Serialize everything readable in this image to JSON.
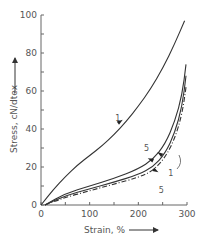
{
  "chart_data": {
    "type": "line",
    "title": "",
    "xlabel": "Strain, %",
    "ylabel": "Stress, cN/dtex",
    "xlim": [
      0,
      300
    ],
    "ylim": [
      0,
      100
    ],
    "x_major_ticks": [
      0,
      100,
      200,
      300
    ],
    "x_tick_labels": [
      "0",
      "100",
      "200",
      "300"
    ],
    "x_minor_ticks": [
      50,
      150,
      250
    ],
    "y_major_ticks": [
      0,
      20,
      40,
      60,
      80,
      100
    ],
    "y_tick_labels": [
      "0",
      "20",
      "40",
      "60",
      "80",
      "100"
    ],
    "y_minor_ticks": [
      10,
      30,
      50,
      70,
      90
    ],
    "grid": false,
    "legend": "none",
    "series": [
      {
        "name": "1 (loading)",
        "label": "1",
        "style": "solid",
        "points": [
          [
            0,
            0
          ],
          [
            25,
            8
          ],
          [
            50,
            15
          ],
          [
            75,
            21
          ],
          [
            100,
            26
          ],
          [
            125,
            31
          ],
          [
            150,
            37
          ],
          [
            175,
            44
          ],
          [
            200,
            52
          ],
          [
            225,
            61
          ],
          [
            250,
            72
          ],
          [
            275,
            85
          ],
          [
            295,
            97
          ]
        ]
      },
      {
        "name": "5 (loading)",
        "label": "5",
        "style": "solid",
        "points": [
          [
            8,
            0
          ],
          [
            50,
            6
          ],
          [
            100,
            10
          ],
          [
            150,
            14
          ],
          [
            200,
            19
          ],
          [
            230,
            24
          ],
          [
            255,
            32
          ],
          [
            275,
            44
          ],
          [
            290,
            58
          ],
          [
            298,
            74
          ]
        ]
      },
      {
        "name": "1 (unloading)",
        "label": "1",
        "style": "solid",
        "points": [
          [
            8,
            0
          ],
          [
            50,
            5
          ],
          [
            100,
            8.5
          ],
          [
            150,
            12
          ],
          [
            200,
            16
          ],
          [
            230,
            20
          ],
          [
            255,
            27
          ],
          [
            275,
            38
          ],
          [
            290,
            52
          ],
          [
            298,
            68
          ]
        ]
      },
      {
        "name": "5 (unloading)",
        "label": "5",
        "style": "dashdot",
        "points": [
          [
            8,
            0
          ],
          [
            50,
            4
          ],
          [
            100,
            7.5
          ],
          [
            150,
            11
          ],
          [
            200,
            14.5
          ],
          [
            230,
            18
          ],
          [
            255,
            25
          ],
          [
            275,
            35
          ],
          [
            290,
            48
          ],
          [
            298,
            62
          ]
        ]
      }
    ],
    "annotations": [
      {
        "text": "1",
        "x": 163,
        "y": 46
      },
      {
        "text": "5",
        "x": 222,
        "y": 30
      },
      {
        "text": "1",
        "x": 272,
        "y": 17
      },
      {
        "text": "5",
        "x": 252,
        "y": 8
      }
    ]
  }
}
